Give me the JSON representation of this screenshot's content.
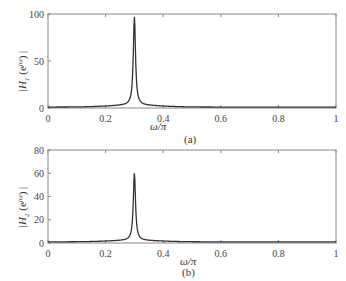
{
  "chart_data": [
    {
      "type": "line",
      "panel": "a",
      "caption": "(a)",
      "xlabel": "ω/π",
      "ylabel": "|H1(e^jω)|",
      "xlim": [
        0,
        1
      ],
      "ylim": [
        0,
        100
      ],
      "xticks": [
        "0",
        "0.2",
        "0.4",
        "0.6",
        "0.8",
        "1"
      ],
      "yticks": [
        "0",
        "50",
        "100"
      ],
      "grid": false,
      "peak": {
        "x": 0.3,
        "y": 97
      },
      "x": [
        0,
        0.1,
        0.2,
        0.25,
        0.28,
        0.29,
        0.295,
        0.3,
        0.305,
        0.31,
        0.32,
        0.35,
        0.4,
        0.5,
        0.6,
        0.8,
        1.0
      ],
      "values": [
        1,
        2,
        4,
        8,
        20,
        40,
        70,
        97,
        70,
        40,
        20,
        8,
        4,
        2,
        1.5,
        1,
        1
      ]
    },
    {
      "type": "line",
      "panel": "b",
      "caption": "(b)",
      "xlabel": "ω/π",
      "ylabel": "|H2(e^jω)|",
      "xlim": [
        0,
        1
      ],
      "ylim": [
        0,
        80
      ],
      "xticks": [
        "0",
        "0.2",
        "0.4",
        "0.6",
        "0.8",
        "1"
      ],
      "yticks": [
        "0",
        "20",
        "40",
        "60",
        "80"
      ],
      "grid": false,
      "peak": {
        "x": 0.3,
        "y": 60
      },
      "x": [
        0,
        0.1,
        0.2,
        0.25,
        0.28,
        0.29,
        0.295,
        0.3,
        0.305,
        0.31,
        0.32,
        0.35,
        0.4,
        0.5,
        0.6,
        0.8,
        1.0
      ],
      "values": [
        1,
        1.5,
        3,
        6,
        14,
        28,
        45,
        60,
        45,
        28,
        14,
        6,
        3,
        1.5,
        1,
        1,
        1
      ]
    }
  ],
  "labels": {
    "a": {
      "ylabel_H": "H",
      "ylabel_sub": "1",
      "ylabel_exp": "jω",
      "xlabel": "ω/π",
      "caption": "(a)"
    },
    "b": {
      "ylabel_H": "H",
      "ylabel_sub": "2",
      "ylabel_exp": "jω",
      "xlabel": "ω/π",
      "caption": "(b)"
    }
  },
  "colors": {
    "line": "#333333",
    "axis": "#888888"
  }
}
